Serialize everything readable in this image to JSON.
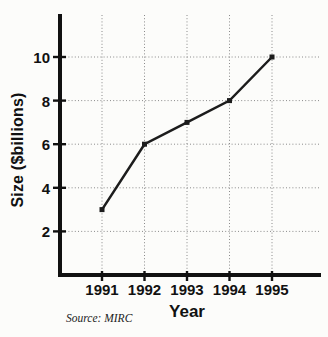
{
  "chart_data": {
    "type": "line",
    "categories": [
      "1991",
      "1992",
      "1993",
      "1994",
      "1995"
    ],
    "values": [
      3,
      6,
      7,
      8,
      10
    ],
    "y_ticks": [
      2,
      4,
      6,
      8,
      10
    ],
    "ylim": [
      0,
      12
    ],
    "xlabel": "Year",
    "ylabel": "Size ($billions)",
    "source": "Source: MIRC",
    "grid": true,
    "legend": false,
    "line_color": "#1c1c1c",
    "axis_color": "#111111",
    "grid_color": "#8a8a8a",
    "marker": "square"
  }
}
